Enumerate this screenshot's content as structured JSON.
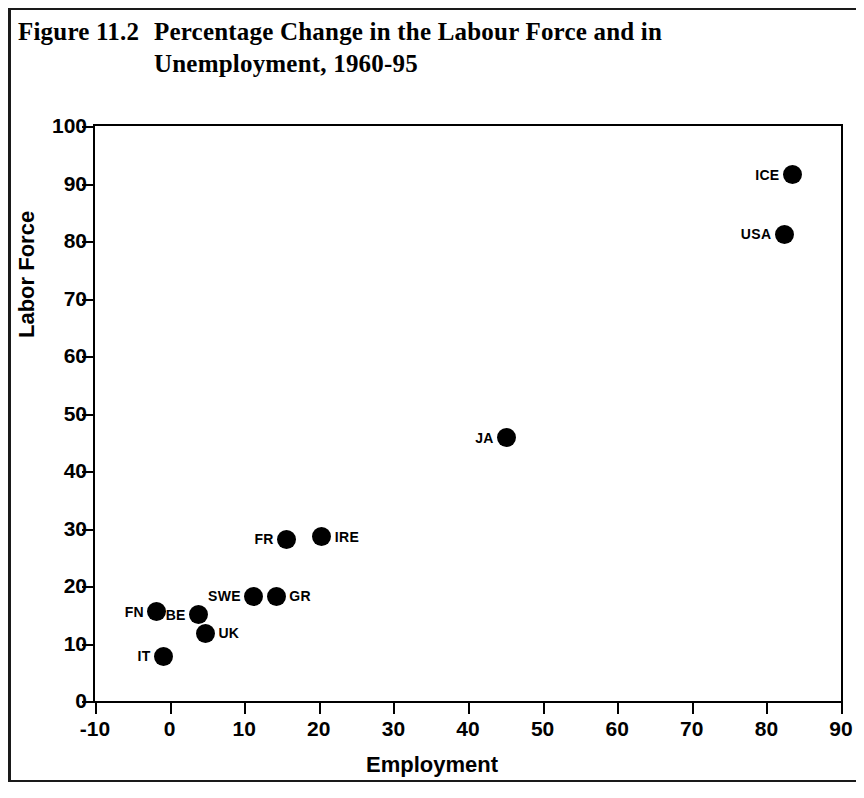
{
  "figure": {
    "label": "Figure 11.2",
    "title_line1": "Percentage Change in the Labour Force and in",
    "title_line2": "Unemployment, 1960-95"
  },
  "chart_data": {
    "type": "scatter",
    "xlabel": "Employment",
    "ylabel": "Labor Force",
    "xlim": [
      -10,
      90
    ],
    "ylim": [
      0,
      100
    ],
    "xticks": [
      "-10",
      "0",
      "10",
      "20",
      "30",
      "40",
      "50",
      "60",
      "70",
      "80",
      "90"
    ],
    "yticks": [
      "0",
      "10",
      "20",
      "30",
      "40",
      "50",
      "60",
      "70",
      "80",
      "90",
      "100"
    ],
    "grid": false,
    "legend": "none",
    "marker_color": "#000000",
    "points": [
      {
        "label": "IT",
        "x": -0.8,
        "y": 7.8,
        "label_side": "left"
      },
      {
        "label": "FN",
        "x": -1.7,
        "y": 15.5,
        "label_side": "left"
      },
      {
        "label": "BE",
        "x": 3.9,
        "y": 15.0,
        "label_side": "left"
      },
      {
        "label": "UK",
        "x": 4.8,
        "y": 11.8,
        "label_side": "right"
      },
      {
        "label": "SWE",
        "x": 11.3,
        "y": 18.2,
        "label_side": "left"
      },
      {
        "label": "GR",
        "x": 14.3,
        "y": 18.2,
        "label_side": "right"
      },
      {
        "label": "FR",
        "x": 15.7,
        "y": 28.1,
        "label_side": "left"
      },
      {
        "label": "IRE",
        "x": 20.4,
        "y": 28.6,
        "label_side": "right"
      },
      {
        "label": "JA",
        "x": 45.2,
        "y": 45.8,
        "label_side": "left"
      },
      {
        "label": "USA",
        "x": 82.4,
        "y": 81.2,
        "label_side": "left"
      },
      {
        "label": "ICE",
        "x": 83.5,
        "y": 91.5,
        "label_side": "left"
      }
    ]
  }
}
